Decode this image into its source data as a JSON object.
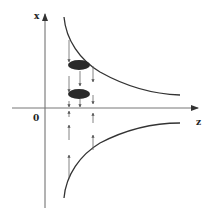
{
  "diagram": {
    "axes": {
      "vertical_label": "x",
      "horizontal_label": "z",
      "origin_label": "0"
    },
    "elements": {
      "upper_curve": "hyperbola-upper-branch",
      "lower_curve": "hyperbola-lower-branch",
      "ellipses": [
        "particle-1",
        "particle-2"
      ],
      "arrows_above_axis": "downward",
      "arrows_below_axis": "upward"
    },
    "colors": {
      "line": "#333333",
      "ellipse_fill": "#2a2a2a",
      "axis": "#555555"
    }
  }
}
